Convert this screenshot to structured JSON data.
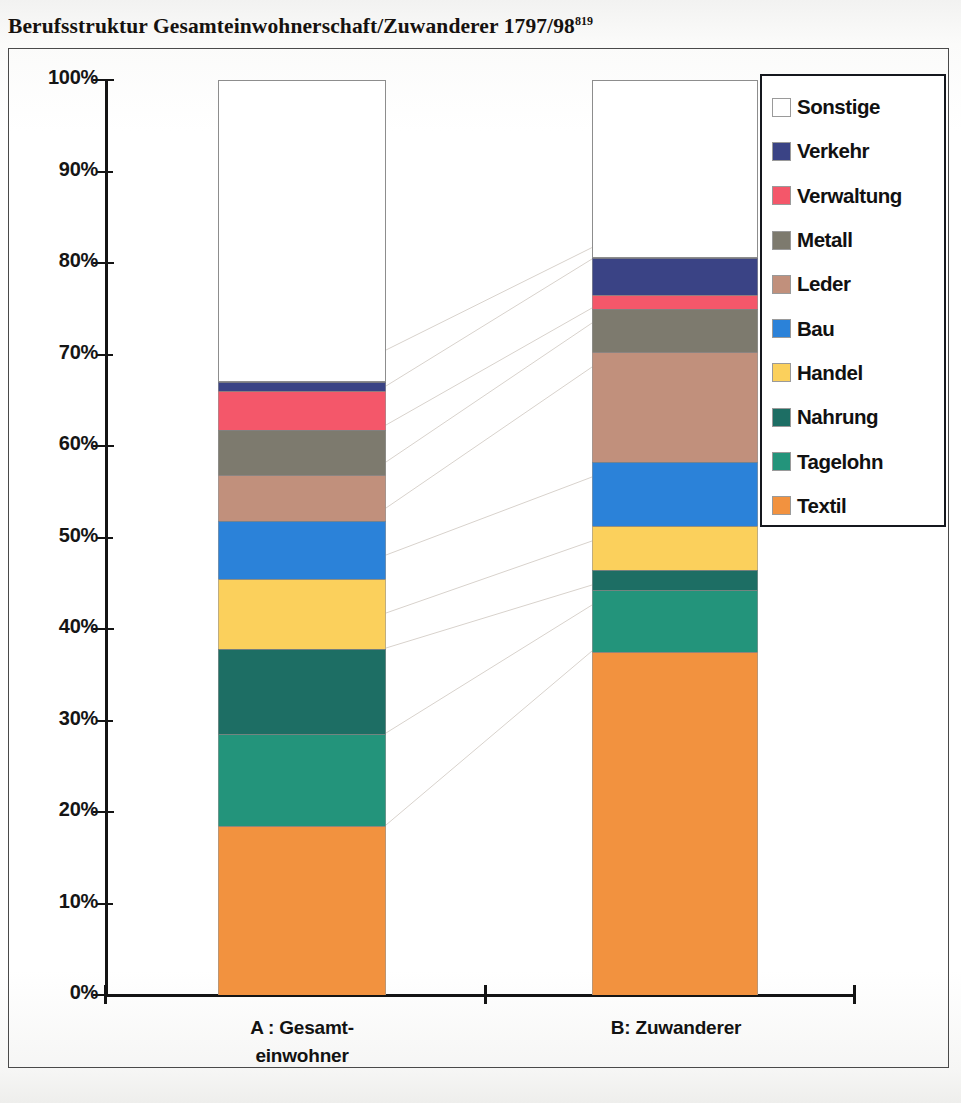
{
  "title": {
    "text": "Berufsstruktur Gesamteinwohnerschaft/Zuwanderer 1797/98",
    "footnote": "819"
  },
  "chart_data": {
    "type": "bar",
    "title": "Berufsstruktur Gesamteinwohnerschaft/Zuwanderer 1797/98",
    "xlabel": "",
    "ylabel": "",
    "ylim": [
      0,
      100
    ],
    "stacked": true,
    "normalized_percent": true,
    "grid": false,
    "legend_position": "right",
    "categories": [
      "A : Gesamt-\neinwohner",
      "B: Zuwanderer"
    ],
    "category_labels": [
      {
        "line1": "A : Gesamt-",
        "line2": "einwohner"
      },
      {
        "line1": "B: Zuwanderer",
        "line2": ""
      }
    ],
    "ytick_labels": [
      "0%",
      "10%",
      "20%",
      "30%",
      "40%",
      "50%",
      "60%",
      "70%",
      "80%",
      "90%",
      "100%"
    ],
    "ytick_values": [
      0,
      10,
      20,
      30,
      40,
      50,
      60,
      70,
      80,
      90,
      100
    ],
    "legend_order_top_to_bottom": [
      "Sonstige",
      "Verkehr",
      "Verwaltung",
      "Metall",
      "Leder",
      "Bau",
      "Handel",
      "Nahrung",
      "Tagelohn",
      "Textil"
    ],
    "series": [
      {
        "name": "Textil",
        "color": "#f2923f",
        "values": [
          18.5,
          37.5
        ]
      },
      {
        "name": "Tagelohn",
        "color": "#23947b",
        "values": [
          10.0,
          6.8
        ]
      },
      {
        "name": "Nahrung",
        "color": "#1d6e64",
        "values": [
          9.3,
          2.2
        ]
      },
      {
        "name": "Handel",
        "color": "#fbd05c",
        "values": [
          7.7,
          4.8
        ]
      },
      {
        "name": "Bau",
        "color": "#2b82d9",
        "values": [
          6.3,
          7.0
        ]
      },
      {
        "name": "Leder",
        "color": "#c1907c",
        "values": [
          5.0,
          12.0
        ]
      },
      {
        "name": "Metall",
        "color": "#7d7a6e",
        "values": [
          5.0,
          4.7
        ]
      },
      {
        "name": "Verwaltung",
        "color": "#f4576a",
        "values": [
          4.2,
          1.5
        ]
      },
      {
        "name": "Verkehr",
        "color": "#3a4385",
        "values": [
          1.0,
          4.0
        ]
      },
      {
        "name": "Sonstige",
        "color": "#ffffff",
        "values": [
          33.0,
          19.5
        ]
      }
    ],
    "cumulative_tops": {
      "A : Gesamt-einwohner": {
        "Textil": 18.5,
        "Tagelohn": 28.5,
        "Nahrung": 37.8,
        "Handel": 45.5,
        "Bau": 51.8,
        "Leder": 56.8,
        "Metall": 61.8,
        "Verwaltung": 66.0,
        "Verkehr": 67.0,
        "Sonstige": 100.0
      },
      "B: Zuwanderer": {
        "Textil": 37.5,
        "Tagelohn": 44.3,
        "Nahrung": 46.5,
        "Handel": 51.3,
        "Bau": 58.3,
        "Leder": 70.3,
        "Metall": 75.0,
        "Verwaltung": 76.5,
        "Verkehr": 80.5,
        "Sonstige": 100.0
      }
    }
  },
  "legend": {
    "items": [
      {
        "label": "Sonstige",
        "color": "#ffffff"
      },
      {
        "label": "Verkehr",
        "color": "#3a4385"
      },
      {
        "label": "Verwaltung",
        "color": "#f4576a"
      },
      {
        "label": "Metall",
        "color": "#7d7a6e"
      },
      {
        "label": "Leder",
        "color": "#c1907c"
      },
      {
        "label": "Bau",
        "color": "#2b82d9"
      },
      {
        "label": "Handel",
        "color": "#fbd05c"
      },
      {
        "label": "Nahrung",
        "color": "#1d6e64"
      },
      {
        "label": "Tagelohn",
        "color": "#23947b"
      },
      {
        "label": "Textil",
        "color": "#f2923f"
      }
    ]
  }
}
